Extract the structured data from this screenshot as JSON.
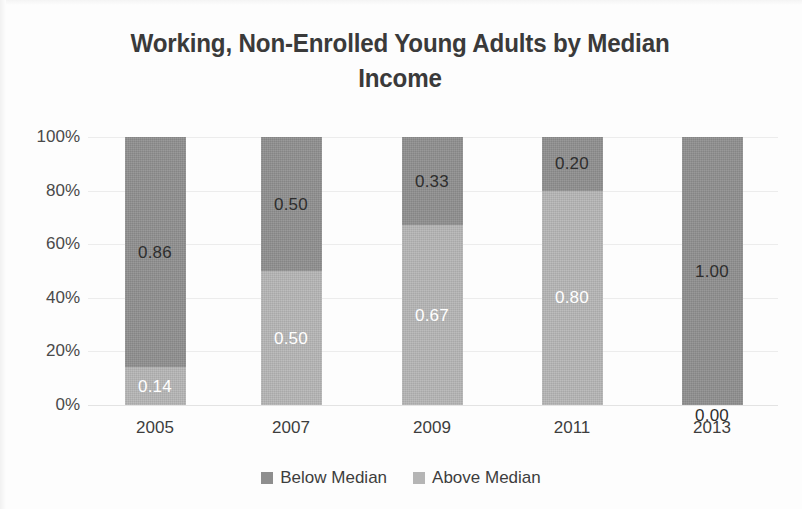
{
  "chart_data": {
    "type": "bar",
    "subtype": "stacked-100-percent",
    "title": "Working, Non-Enrolled Young Adults by Median Income",
    "xlabel": "",
    "ylabel": "",
    "categories": [
      "2005",
      "2007",
      "2009",
      "2011",
      "2013"
    ],
    "series": [
      {
        "name": "Below Median",
        "color": "#8e8e8e",
        "values": [
          0.86,
          0.5,
          0.33,
          0.2,
          1.0
        ],
        "labels": [
          "0.86",
          "0.50",
          "0.33",
          "0.20",
          "1.00"
        ]
      },
      {
        "name": "Above Median",
        "color": "#b5b5b5",
        "values": [
          0.14,
          0.5,
          0.67,
          0.8,
          0.0
        ],
        "labels": [
          "0.14",
          "0.50",
          "0.67",
          "0.80",
          "0.00"
        ]
      }
    ],
    "ylim": [
      0,
      1
    ],
    "yticks": [
      "0%",
      "20%",
      "40%",
      "60%",
      "80%",
      "100%"
    ],
    "ytick_values": [
      0,
      0.2,
      0.4,
      0.6,
      0.8,
      1.0
    ],
    "grid": true,
    "legend_position": "bottom",
    "stack_order": "above-median-bottom"
  },
  "legend": {
    "items": [
      {
        "label": "Below Median",
        "color": "#8e8e8e"
      },
      {
        "label": "Above Median",
        "color": "#b5b5b5"
      }
    ]
  },
  "colors": {
    "below_median": "#8e8e8e",
    "above_median": "#b5b5b5",
    "gridline": "#ececec",
    "text": "#3b3b3b",
    "background": "#fdfdfd"
  }
}
